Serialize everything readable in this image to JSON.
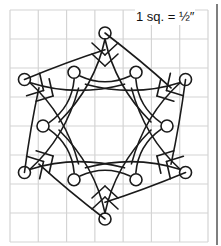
{
  "diagram": {
    "scale_label": "1 sq. = ½″",
    "grid": {
      "columns": 7,
      "rows": 8
    },
    "colors": {
      "grid_line": "#d4d4d4",
      "stroke": "#1a1a1a",
      "border": "#555555",
      "background": "#ffffff"
    },
    "snowflake": {
      "arms": 6,
      "outer_circles": 6,
      "inner_circles": 6,
      "tines_per_arm": 2
    }
  }
}
